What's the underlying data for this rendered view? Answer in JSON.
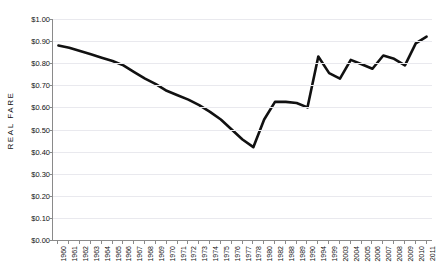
{
  "chart_data": {
    "type": "line",
    "title": "",
    "xlabel": "",
    "ylabel": "REAL FARE",
    "ylim": [
      0.0,
      1.0
    ],
    "ytick_step": 0.1,
    "grid": true,
    "legend": "none",
    "line_color": "#111111",
    "grid_color": "#e9e9ee",
    "axis_color": "#8a8a8a",
    "ytick_labels": [
      "$1.00",
      "$0.90",
      "$0.80",
      "$0.70",
      "$0.60",
      "$0.50",
      "$0.40",
      "$0.30",
      "$0.20",
      "$0.10",
      "$0.00"
    ],
    "ytick_values": [
      1.0,
      0.9,
      0.8,
      0.7,
      0.6,
      0.5,
      0.4,
      0.3,
      0.2,
      0.1,
      0.0
    ],
    "categories": [
      "1960",
      "1961",
      "1962",
      "1963",
      "1964",
      "1965",
      "1966",
      "1967",
      "1968",
      "1969",
      "1970",
      "1971",
      "1972",
      "1973",
      "1974",
      "1975",
      "1976",
      "1977",
      "1978",
      "1980",
      "1982",
      "1988",
      "1989",
      "1990",
      "1994",
      "1999",
      "2003",
      "2004",
      "2005",
      "2006",
      "2007",
      "2008",
      "2009",
      "2010",
      "2011"
    ],
    "values": [
      0.88,
      0.87,
      0.855,
      0.84,
      0.825,
      0.81,
      0.79,
      0.76,
      0.73,
      0.705,
      0.675,
      0.655,
      0.635,
      0.61,
      0.58,
      0.545,
      0.5,
      0.455,
      0.42,
      0.545,
      0.625,
      0.625,
      0.62,
      0.6,
      0.83,
      0.755,
      0.73,
      0.815,
      0.795,
      0.775,
      0.835,
      0.82,
      0.79,
      0.89,
      0.92
    ]
  }
}
